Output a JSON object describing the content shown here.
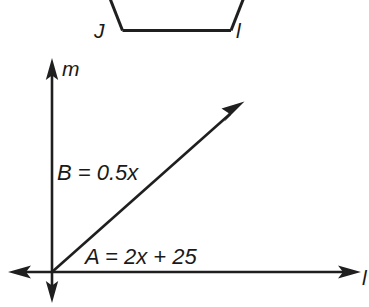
{
  "figure": {
    "background_color": "#ffffff",
    "ink_color": "#1f1f1f"
  },
  "top_shape": {
    "name": "partial-quadrilateral",
    "description": "Bottom portion of a trapezoid with two slanted sides and a horizontal base",
    "vertex_labels": [
      {
        "id": "J",
        "text": "J",
        "position": "bottom-left"
      },
      {
        "id": "I",
        "text": "l",
        "position": "bottom-right"
      }
    ]
  },
  "axes": {
    "vertical_line_label": "m",
    "horizontal_line_label": "l",
    "origin_label": ""
  },
  "angles": [
    {
      "id": "B",
      "label": "B = 0.5x",
      "name_part": "B",
      "expression": "0.5x",
      "position": "above-ray-left"
    },
    {
      "id": "A",
      "label": "A = 2x + 25",
      "name_part": "A",
      "expression": "2x + 25",
      "position": "below-ray-right"
    }
  ],
  "ray": {
    "name": "diagonal-ray",
    "from": "origin",
    "direction": "up-right",
    "arrowhead": true
  }
}
